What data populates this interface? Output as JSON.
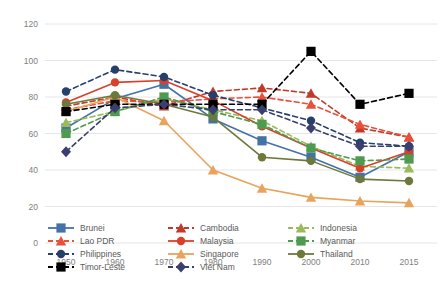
{
  "chart_data": {
    "type": "line",
    "title": "",
    "subtitle": "",
    "xlabel": "",
    "ylabel": "",
    "x": [
      1950,
      1960,
      1970,
      1980,
      1990,
      2000,
      2010,
      2015
    ],
    "xtick_labels": [
      "1950",
      "1960",
      "1970",
      "1980",
      "1990",
      "2000",
      "2010",
      "2015"
    ],
    "ytick_labels": [
      "0",
      "20",
      "40",
      "60",
      "80",
      "100",
      "120"
    ],
    "yticks": [
      0,
      20,
      40,
      60,
      80,
      100,
      120
    ],
    "ylim": [
      0,
      120
    ],
    "grid": "horizontal",
    "legend_position": "bottom",
    "series": [
      {
        "name": "Brunei",
        "color": "#4472a8",
        "dash": "solid",
        "marker": "square",
        "values": [
          63,
          79,
          87,
          68,
          56,
          47,
          36,
          50
        ]
      },
      {
        "name": "Cambodia",
        "color": "#c0392b",
        "dash": "dashed",
        "marker": "triangle",
        "values": [
          75,
          80,
          75,
          83,
          85,
          82,
          63,
          58
        ]
      },
      {
        "name": "Indonesia",
        "color": "#9bbb59",
        "dash": "dashed",
        "marker": "triangle",
        "values": [
          66,
          72,
          79,
          73,
          67,
          53,
          42,
          41
        ]
      },
      {
        "name": "Lao PDR",
        "color": "#e8503a",
        "dash": "dashed",
        "marker": "triangle",
        "values": [
          73,
          78,
          77,
          79,
          80,
          76,
          65,
          58
        ]
      },
      {
        "name": "Malaysia",
        "color": "#d9402a",
        "dash": "solid",
        "marker": "circle",
        "values": [
          77,
          88,
          89,
          78,
          64,
          52,
          41,
          50
        ]
      },
      {
        "name": "Myanmar",
        "color": "#4e9a4e",
        "dash": "dashed",
        "marker": "square",
        "values": [
          60,
          72,
          80,
          72,
          65,
          52,
          45,
          46
        ]
      },
      {
        "name": "Philippines",
        "color": "#27406b",
        "dash": "dashed",
        "marker": "circle",
        "values": [
          83,
          95,
          91,
          81,
          74,
          67,
          55,
          53
        ]
      },
      {
        "name": "Singapore",
        "color": "#e8a35c",
        "dash": "solid",
        "marker": "triangle",
        "values": [
          72,
          80,
          67,
          40,
          30,
          25,
          23,
          22
        ]
      },
      {
        "name": "Thailand",
        "color": "#6b7a3a",
        "dash": "solid",
        "marker": "circle",
        "values": [
          76,
          81,
          76,
          69,
          47,
          45,
          35,
          34
        ]
      },
      {
        "name": "Timor-Leste",
        "color": "#000000",
        "dash": "dashed",
        "marker": "square",
        "values": [
          72,
          76,
          76,
          76,
          76,
          105,
          76,
          82
        ]
      },
      {
        "name": "Viet Nam",
        "color": "#3b3f6e",
        "dash": "dashed",
        "marker": "diamond",
        "values": [
          50,
          74,
          76,
          73,
          73,
          63,
          53,
          53
        ]
      }
    ]
  },
  "legend": {
    "columns": [
      [
        "Brunei",
        "Lao PDR",
        "Philippines",
        "Timor-Leste"
      ],
      [
        "Cambodia",
        "Malaysia",
        "Singapore",
        "Viet Nam"
      ],
      [
        "Indonesia",
        "Myanmar",
        "Thailand"
      ]
    ]
  }
}
